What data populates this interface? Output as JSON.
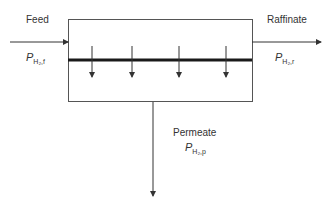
{
  "diagram": {
    "type": "membrane-separation-unit",
    "streams": {
      "feed": {
        "label": "Feed",
        "pressure_symbol": "P",
        "pressure_subscript": "H₂,f"
      },
      "raffinate": {
        "label": "Raffinate",
        "pressure_symbol": "P",
        "pressure_subscript": "H₂,r"
      },
      "permeate": {
        "label": "Permeate",
        "pressure_symbol": "P",
        "pressure_subscript": "H₂,p"
      }
    },
    "membrane_flux_arrows": 4,
    "colors": {
      "line": "#333333",
      "membrane": "#1a1a1a",
      "background": "#ffffff"
    }
  }
}
